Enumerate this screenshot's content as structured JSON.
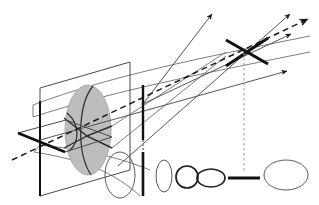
{
  "figure": {
    "type": "optical-ray-diagram",
    "width": 319,
    "height": 205,
    "background_color": "#ffffff"
  },
  "colors": {
    "ray_thin": "#55555a",
    "ray_thick": "#1a1a1a",
    "envelope": "#6e6e73",
    "plane_outline": "#4a4a4f",
    "sphere_fill": "#bdbdbd",
    "sphere_stroke": "#a8a8a8",
    "arc_stroke": "#2b2b2b",
    "dashed_ray": "#1a1a1a",
    "dotted_guide": "#9a9a9f",
    "spot_outline": "#5a5a60",
    "spot_outline_dark": "#1f1f22",
    "thick_bar": "#111111"
  },
  "elements": {
    "object_plane": {
      "name": "vertical-object-plane",
      "points": "40,88 130,62 130,170 40,196"
    },
    "object_plane_edge_bar": {
      "name": "vertical-plane-left-edge-bar",
      "x1": 40,
      "y1": 101,
      "x2": 40,
      "y2": 196
    },
    "horizontal_plane": {
      "name": "horizontal-meridional-plane",
      "points": "18,133 65,152 112,137 66,120"
    },
    "horizontal_plane_edge_bar": {
      "name": "horizontal-plane-front-edge-bar",
      "x1": 18,
      "y1": 133,
      "x2": 65,
      "y2": 152
    },
    "sphere": {
      "name": "lens-sphere",
      "cx": 88,
      "cy": 130,
      "rx": 23,
      "ry": 45
    },
    "sphere_arc_vertical": {
      "name": "sphere-meridian-arc",
      "d": "M 92,86 C 78,104 76,152 90,174"
    },
    "sphere_arc_horizontal": {
      "name": "sphere-equator-arc",
      "d": "M 68,114 C 80,126 80,140 70,150"
    },
    "sphere_arc_ray_fold": {
      "name": "sphere-internal-ray-fold",
      "d": "M 66,119 L 88,137 L 112,126"
    },
    "sphere_arc_ray_fold2": {
      "name": "sphere-internal-ray-fold-lower",
      "d": "M 66,147 L 88,137 L 112,148"
    },
    "waist_plane_bar": {
      "name": "first-focus-vertical-bar",
      "x1": 143,
      "y1": 85,
      "x2": 143,
      "y2": 196
    },
    "cross_bar_a": {
      "name": "second-focus-cross-bar-a",
      "x1": 226,
      "y1": 40,
      "x2": 268,
      "y2": 64
    },
    "cross_bar_b": {
      "name": "second-focus-cross-bar-b",
      "x1": 268,
      "y1": 38,
      "x2": 226,
      "y2": 66
    },
    "guide_dotted_left": {
      "name": "waist-drop-guide-left",
      "x1": 143,
      "y1": 140,
      "x2": 143,
      "y2": 196
    },
    "guide_dotted_right": {
      "name": "focus-drop-guide-right",
      "x1": 244,
      "y1": 52,
      "x2": 244,
      "y2": 170
    },
    "beam_envelope": [
      {
        "name": "envelope-upper-outer",
        "d": "M 33,105 C 110,76 200,58 310,36"
      },
      {
        "name": "envelope-upper-inner",
        "d": "M 33,117 C 110,92 200,74 310,52"
      },
      {
        "name": "envelope-lower-inner",
        "d": "M 40,145 C 90,150 120,158 150,170"
      },
      {
        "name": "envelope-lower-outer",
        "d": "M 34,152 C 84,160 114,172 140,196"
      },
      {
        "name": "envelope-converge-top",
        "d": "M 112,126 L 226,52"
      },
      {
        "name": "envelope-converge-bottom",
        "d": "M 112,148 L 226,56"
      }
    ],
    "rays": [
      {
        "name": "ray-marginal-upper-to-arrow1",
        "x1": 143,
        "y1": 104,
        "x2": 212,
        "y2": 14,
        "arrow": true
      },
      {
        "name": "ray-marginal-lower-long",
        "x1": 118,
        "y1": 166,
        "x2": 290,
        "y2": 14,
        "arrow": true
      },
      {
        "name": "ray-chief-axis",
        "x1": 143,
        "y1": 104,
        "x2": 291,
        "y2": 34,
        "arrow": true
      },
      {
        "name": "ray-lower-to-arrow4",
        "x1": 40,
        "y1": 140,
        "x2": 287,
        "y2": 71,
        "arrow": true
      }
    ],
    "dashed_ray": {
      "name": "optical-axis-dashed-ray",
      "x1": 12,
      "y1": 160,
      "x2": 308,
      "y2": 19,
      "arrow": true
    },
    "spot_sequence": [
      {
        "name": "spot-tall-ellipse-1",
        "shape": "ellipse",
        "cx": 120,
        "cy": 175,
        "rx": 15,
        "ry": 23,
        "weight": 1.0,
        "color": "#5a5a60"
      },
      {
        "name": "spot-vertical-line",
        "shape": "vline",
        "x": 143,
        "y1": 152,
        "y2": 196,
        "weight": 2.6,
        "color": "#111111"
      },
      {
        "name": "spot-tall-ellipse-2",
        "shape": "ellipse",
        "cx": 164,
        "cy": 176,
        "rx": 8,
        "ry": 16,
        "weight": 1.0,
        "color": "#5a5a60"
      },
      {
        "name": "spot-circle",
        "shape": "ellipse",
        "cx": 187,
        "cy": 177,
        "rx": 11,
        "ry": 11,
        "weight": 1.7,
        "color": "#1f1f22"
      },
      {
        "name": "spot-wide-ellipse-small",
        "shape": "ellipse",
        "cx": 211,
        "cy": 178,
        "rx": 14,
        "ry": 9,
        "weight": 1.7,
        "color": "#1f1f22"
      },
      {
        "name": "spot-horizontal-line",
        "shape": "hline",
        "y": 178,
        "x1": 228,
        "x2": 260,
        "weight": 3.0,
        "color": "#111111"
      },
      {
        "name": "spot-wide-ellipse-large",
        "shape": "ellipse",
        "cx": 286,
        "cy": 175,
        "rx": 22,
        "ry": 15,
        "weight": 1.0,
        "color": "#5a5a60"
      }
    ]
  }
}
